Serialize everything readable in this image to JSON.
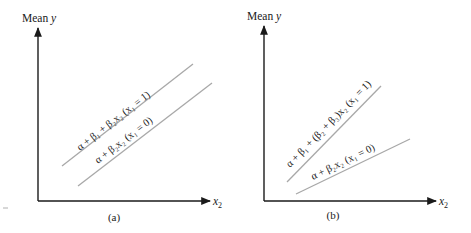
{
  "figure": {
    "panels": [
      {
        "id": "a",
        "caption": "(a)",
        "y_axis_label": "Mean",
        "y_axis_var": "y",
        "x_axis_var": "x",
        "x_axis_sub": "2",
        "lines": [
          {
            "label": "α + β₁ + β₂x₂  (x₁ = 1)",
            "group": "x1=1",
            "slope": "β₂"
          },
          {
            "label": "α + β₂x₂  (x₁ = 0)",
            "group": "x1=0",
            "slope": "β₂"
          }
        ]
      },
      {
        "id": "b",
        "caption": "(b)",
        "y_axis_label": "Mean",
        "y_axis_var": "y",
        "x_axis_var": "x",
        "x_axis_sub": "2",
        "lines": [
          {
            "label": "α + β₁ + (β₂ + β₃)x₂  (x₁ = 1)",
            "group": "x1=1",
            "slope": "β₂ + β₃"
          },
          {
            "label": "α + β₂x₂  (x₁ = 0)",
            "group": "x1=0",
            "slope": "β₂"
          }
        ]
      }
    ],
    "colors": {
      "axis": "#1a1a1a",
      "line": "#a8a8a8",
      "text": "#1a1a1a"
    }
  }
}
